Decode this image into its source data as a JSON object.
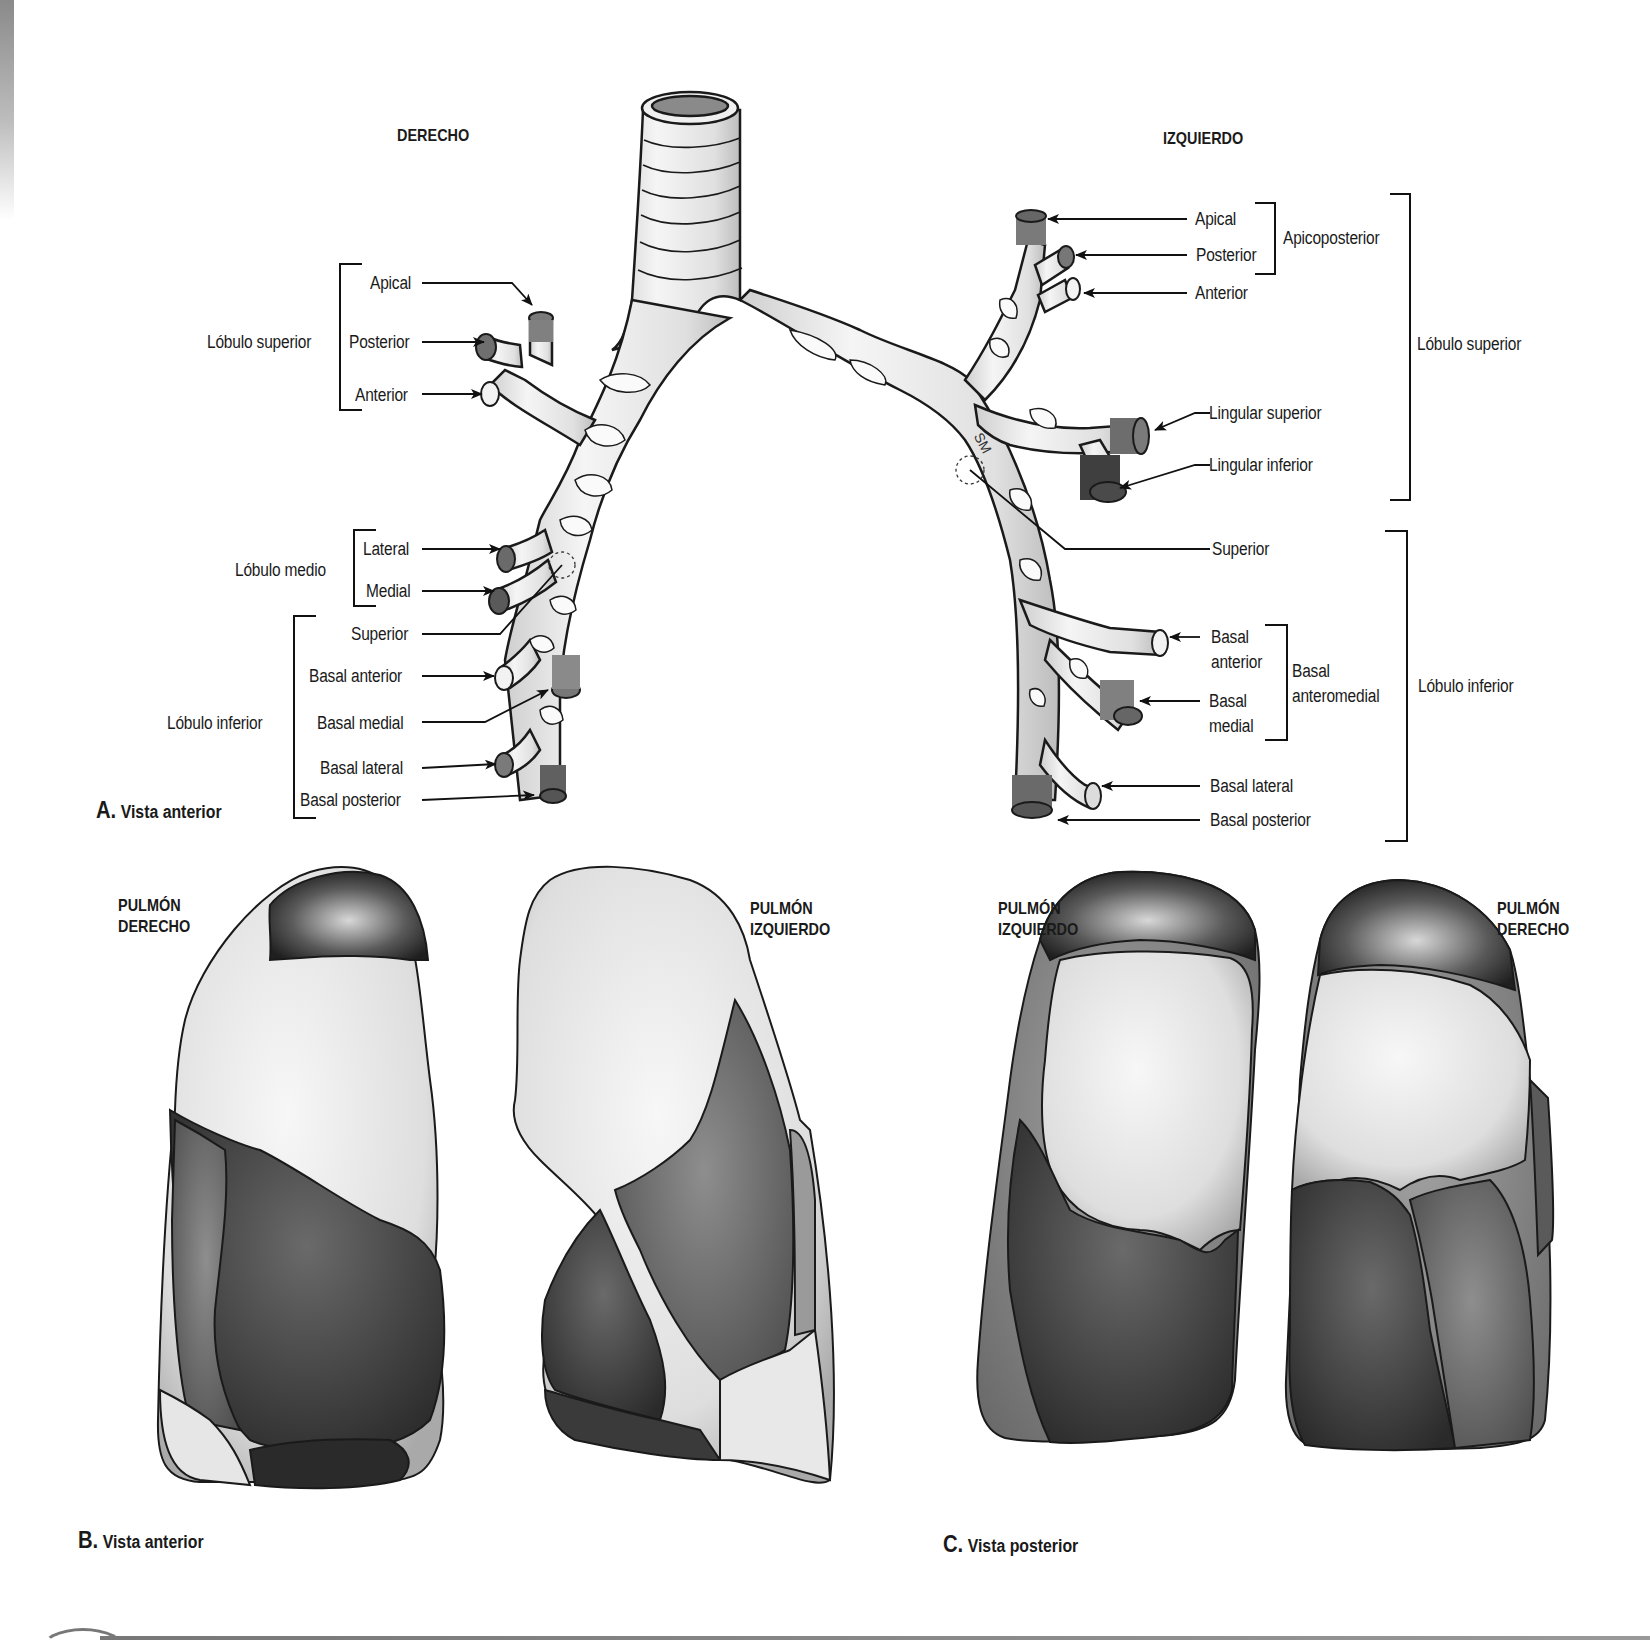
{
  "panel_a": {
    "caption_letter": "A.",
    "caption_text": "Vista anterior",
    "side_right_header": "DERECHO",
    "side_left_header": "IZQUIERDO",
    "right_lung": {
      "lobe_superior": {
        "label": "Lóbulo superior",
        "segments": [
          "Apical",
          "Posterior",
          "Anterior"
        ]
      },
      "lobe_medio": {
        "label": "Lóbulo medio",
        "segments": [
          "Lateral",
          "Medial"
        ]
      },
      "lobe_inferior": {
        "label": "Lóbulo inferior",
        "segments": [
          "Superior",
          "Basal anterior",
          "Basal medial",
          "Basal lateral",
          "Basal posterior"
        ]
      }
    },
    "left_lung": {
      "lobe_superior": {
        "label": "Lóbulo superior",
        "group_label": "Apicoposterior",
        "segments": [
          "Apical",
          "Posterior",
          "Anterior",
          "Lingular superior",
          "Lingular inferior"
        ]
      },
      "lobe_inferior": {
        "label": "Lóbulo inferior",
        "group_label_line1": "Basal",
        "group_label_line2": "anteromedial",
        "segments": {
          "superior": "Superior",
          "basal_anterior_1": "Basal",
          "basal_anterior_2": "anterior",
          "basal_medial_1": "Basal",
          "basal_medial_2": "medial",
          "basal_lateral": "Basal lateral",
          "basal_posterior": "Basal posterior"
        }
      }
    },
    "annotation_sm": "SM"
  },
  "panel_b": {
    "caption_letter": "B.",
    "caption_text": "Vista anterior",
    "right_lung_label_1": "PULMÓN",
    "right_lung_label_2": "DERECHO",
    "left_lung_label_1": "PULMÓN",
    "left_lung_label_2": "IZQUIERDO"
  },
  "panel_c": {
    "caption_letter": "C.",
    "caption_text": "Vista posterior",
    "left_lung_label_1": "PULMÓN",
    "left_lung_label_2": "IZQUIERDO",
    "right_lung_label_1": "PULMÓN",
    "right_lung_label_2": "DERECHO"
  },
  "colors": {
    "outline": "#1a1a1a",
    "light_segment": "#ececec",
    "mid_segment": "#8c8c8c",
    "dark_segment": "#555555",
    "darkest_segment": "#2e2e2e"
  }
}
